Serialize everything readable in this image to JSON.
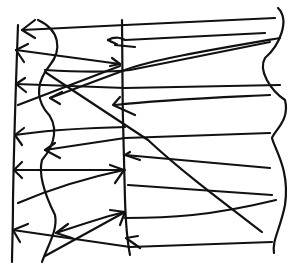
{
  "diagram": {
    "ink_color": "#111111",
    "background": "#ffffff",
    "elements": [
      {
        "kind": "vertical-line",
        "name": "left-axis"
      },
      {
        "kind": "vertical-line",
        "name": "middle-axis"
      },
      {
        "kind": "wavy-line",
        "name": "left-wave"
      },
      {
        "kind": "wavy-line",
        "name": "right-wave"
      },
      {
        "kind": "arrow-lines",
        "count": 20
      }
    ]
  }
}
